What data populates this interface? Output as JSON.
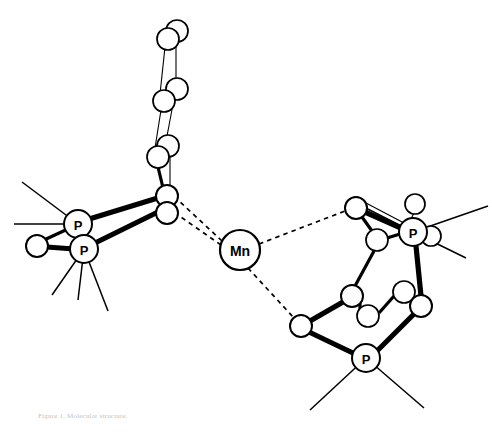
{
  "figure": {
    "caption": "Figure 1.  Molecular structure.",
    "style": "ball-and-stick ORTEP-like line drawing",
    "background_color": "#ffffff",
    "line_color": "#000000",
    "width": 492,
    "height": 432
  },
  "labels": {
    "metal": "Mn",
    "phosphorus": "P"
  },
  "atoms": {
    "metal_center": {
      "label": "Mn",
      "x": 240,
      "y": 250,
      "r": 20,
      "stroke_width": 2.2,
      "font_size": 14
    },
    "phosphorus": [
      {
        "name": "P-left-upper",
        "label": "P",
        "x": 78,
        "y": 224,
        "r": 14,
        "stroke_width": 2.0,
        "font_size": 13
      },
      {
        "name": "P-left-lower",
        "label": "P",
        "x": 84,
        "y": 249,
        "r": 14,
        "stroke_width": 2.0,
        "font_size": 13
      },
      {
        "name": "P-right-upper",
        "label": "P",
        "x": 413,
        "y": 232,
        "r": 14,
        "stroke_width": 2.0,
        "font_size": 13
      },
      {
        "name": "P-bottom-right",
        "label": "P",
        "x": 366,
        "y": 358,
        "r": 14,
        "stroke_width": 2.0,
        "font_size": 13
      }
    ],
    "carbons": [
      {
        "name": "c-chain-top-a",
        "x": 168,
        "y": 39,
        "r": 11,
        "sw": 1.7
      },
      {
        "name": "c-chain-top-b",
        "x": 177,
        "y": 31,
        "r": 11,
        "sw": 1.7
      },
      {
        "name": "c-chain-mid-a",
        "x": 164,
        "y": 101,
        "r": 11,
        "sw": 1.7
      },
      {
        "name": "c-chain-mid-b",
        "x": 177,
        "y": 89,
        "r": 11,
        "sw": 1.7
      },
      {
        "name": "c-chain-low-a",
        "x": 158,
        "y": 157,
        "r": 11,
        "sw": 1.7
      },
      {
        "name": "c-chain-low-b",
        "x": 168,
        "y": 146,
        "r": 11,
        "sw": 1.7
      },
      {
        "name": "c-junction-upper",
        "x": 167,
        "y": 196,
        "r": 11,
        "sw": 2.0
      },
      {
        "name": "c-junction-lower",
        "x": 167,
        "y": 213,
        "r": 11,
        "sw": 2.0
      },
      {
        "name": "c-left-terminal",
        "x": 37,
        "y": 246,
        "r": 11,
        "sw": 2.0
      },
      {
        "name": "c-right-top",
        "x": 356,
        "y": 208,
        "r": 11,
        "sw": 2.0
      },
      {
        "name": "c-right-inner-top",
        "x": 377,
        "y": 240,
        "r": 11,
        "sw": 1.7
      },
      {
        "name": "c-right-p-up",
        "x": 415,
        "y": 204,
        "r": 10,
        "sw": 1.7
      },
      {
        "name": "c-right-p-side",
        "x": 431,
        "y": 236,
        "r": 10,
        "sw": 1.7
      },
      {
        "name": "c-right-mid-left",
        "x": 352,
        "y": 296,
        "r": 11,
        "sw": 2.0
      },
      {
        "name": "c-right-mid-inner",
        "x": 368,
        "y": 316,
        "r": 11,
        "sw": 1.7
      },
      {
        "name": "c-right-mid-right",
        "x": 404,
        "y": 292,
        "r": 11,
        "sw": 1.7
      },
      {
        "name": "c-right-lower-right",
        "x": 421,
        "y": 306,
        "r": 11,
        "sw": 2.0
      },
      {
        "name": "c-left-lower-ring",
        "x": 301,
        "y": 326,
        "r": 11,
        "sw": 2.0
      }
    ]
  },
  "bonds": {
    "dashed_coordination": [
      {
        "from": "Mn",
        "to": "c-junction-upper"
      },
      {
        "from": "Mn",
        "to": "c-junction-lower"
      },
      {
        "from": "Mn",
        "to": "c-right-top"
      },
      {
        "from": "Mn",
        "to": "c-left-lower-ring"
      }
    ],
    "description": "Four dashed lines radiate from the Mn centre: two toward the left bridging carbons, one to the upper-right ring carbon, one to the lower-right ring carbon."
  },
  "substituents": {
    "note": "Thin straight lines radiating outward from each P atom represent phenyl/alkyl substituent bonds truncated at the figure edge.",
    "counts": {
      "P-left-upper": 2,
      "P-left-lower": 3,
      "P-right-upper": 2,
      "P-bottom-right": 2
    }
  },
  "caption_text": "Figure 1.  Molecular structure."
}
